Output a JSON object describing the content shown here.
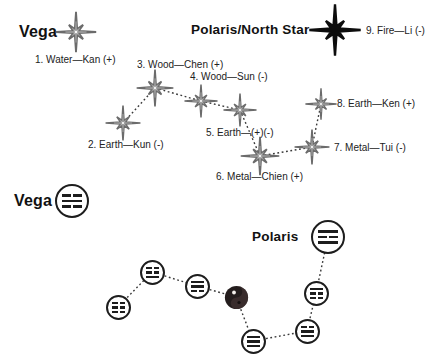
{
  "colors": {
    "star_outline": "#6b6b6b",
    "star_black": "#0d0d0d",
    "circle_outline": "#1d1d1d",
    "dotted_line": "#3a3a3a",
    "background": "#ffffff"
  },
  "top": {
    "vega": {
      "title": "Vega",
      "label": "1. Water—Kan (+)",
      "trigram": "kan"
    },
    "polaris": {
      "title": "Polaris/North Star",
      "label": "9. Fire—Li (-)",
      "trigram": "li"
    },
    "stars": [
      {
        "id": "kun",
        "label": "2. Earth—Kun (-)",
        "trigram": "kun"
      },
      {
        "id": "chen",
        "label": "3. Wood—Chen (+)",
        "trigram": "chen"
      },
      {
        "id": "sun",
        "label": "4. Wood—Sun (-)",
        "trigram": "sun"
      },
      {
        "id": "earth5",
        "label": "5. Earth—(+)(-)",
        "trigram": "taiji"
      },
      {
        "id": "chien",
        "label": "6. Metal—Chien (+)",
        "trigram": "chien"
      },
      {
        "id": "tui",
        "label": "7. Metal—Tui (-)",
        "trigram": "tui"
      },
      {
        "id": "ken",
        "label": "8. Earth—Ken (+)",
        "trigram": "ken"
      }
    ]
  },
  "bottom": {
    "vega": {
      "title": "Vega",
      "trigram": "kan"
    },
    "polaris": {
      "title": "Polaris",
      "trigram": "li"
    },
    "nodes": [
      {
        "id": "kun",
        "trigram": "kun"
      },
      {
        "id": "chen",
        "trigram": "chen"
      },
      {
        "id": "sun",
        "trigram": "sun"
      },
      {
        "id": "taiji-center",
        "trigram": null
      },
      {
        "id": "chien",
        "trigram": "chien"
      },
      {
        "id": "tui",
        "trigram": "tui"
      },
      {
        "id": "ken",
        "trigram": "ken"
      }
    ]
  },
  "trigrams": {
    "kan": [
      0,
      1,
      0
    ],
    "li": [
      1,
      0,
      1
    ],
    "kun": [
      0,
      0,
      0
    ],
    "chen": [
      0,
      0,
      1
    ],
    "sun": [
      1,
      1,
      0
    ],
    "chien": [
      1,
      1,
      1
    ],
    "tui": [
      0,
      1,
      1
    ],
    "ken": [
      1,
      0,
      0
    ]
  }
}
